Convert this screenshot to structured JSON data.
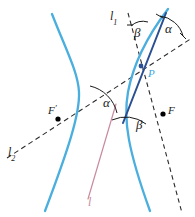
{
  "figure": {
    "canvas": {
      "width": 195,
      "height": 217,
      "background": "#ffffff"
    },
    "colors": {
      "curve_light_blue": "#4aaede",
      "tangent_dark_blue": "#2a4f93",
      "line_pink": "#c98a9e",
      "dashed_black": "#2b2b2b",
      "arc_black": "#1a1a1a",
      "point_black": "#000000",
      "label_blue": "#3aa8dc"
    },
    "labels": {
      "l1": {
        "text": "l",
        "sub": "1"
      },
      "l2": {
        "text": "l",
        "sub": "2"
      },
      "l": {
        "text": "l"
      },
      "alpha_top": {
        "text": "α"
      },
      "alpha_center": {
        "text": "α"
      },
      "beta_top": {
        "text": "β"
      },
      "beta_lower": {
        "text": "β"
      },
      "point_P": {
        "text": "P"
      },
      "focus_F": {
        "text": "F"
      },
      "focus_Fprime": {
        "text": "F",
        "prime": "′"
      }
    },
    "elements": {
      "left_branch": "hyperbola-left-branch",
      "right_branch": "hyperbola-right-branch",
      "tangent_line": "tangent-line-at-P",
      "focal_chord_dashed": "dashed-line-through-F-prime-and-P",
      "dashed_line_l1": "dashed-line-l1-through-P-and-F",
      "pink_line": "pink-line-l",
      "point_P": "tangency-point-P",
      "point_F": "focus-F",
      "point_F_prime": "focus-F-prime"
    }
  }
}
